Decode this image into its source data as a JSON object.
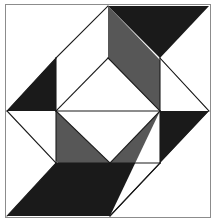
{
  "canvas": {
    "width": 216,
    "height": 223,
    "background_color": "#ffffff",
    "title": "Quilt Block Pattern"
  },
  "frame": {
    "border_color": "#8c8c8c",
    "border_width": 1,
    "margin_color": "#ffffff",
    "inset_left": 5,
    "inset_top": 4,
    "inset_right": 211,
    "inset_bottom": 218
  },
  "palette": {
    "black": "#1a1a1a",
    "gray": "#575757",
    "white": "#ffffff",
    "outline": "#1a1a1a",
    "outline_width": 1.1
  },
  "geometry": {
    "field_left": 7,
    "field_top": 6,
    "field_right": 209,
    "field_bottom": 216,
    "center_x": 108,
    "center_y": 111,
    "mid_top_x": 108,
    "mid_bottom_x": 110,
    "mid_left_y": 111,
    "mid_right_y": 111,
    "diamond_top_y": 58,
    "diamond_bottom_y": 163,
    "diamond_left_x": 56,
    "diamond_right_x": 160
  },
  "shapes": [
    {
      "id": "gray-field",
      "name": "gray-background-field",
      "fill": "gray",
      "points": "7,6 209,6 209,216 7,216"
    },
    {
      "id": "corner-tl",
      "name": "corner-triangle-top-left",
      "fill": "white",
      "points": "7,6 108,6 7,111"
    },
    {
      "id": "corner-tr",
      "name": "corner-triangle-top-right",
      "fill": "white",
      "points": "108,6 209,6 209,111"
    },
    {
      "id": "corner-br",
      "name": "corner-triangle-bottom-right",
      "fill": "white",
      "points": "209,111 209,216 110,216"
    },
    {
      "id": "corner-bl",
      "name": "corner-triangle-bottom-left",
      "fill": "white",
      "points": "7,111 110,216 7,216"
    },
    {
      "id": "black-tl",
      "name": "black-triangle-top-left",
      "fill": "black",
      "points": "7,111 56,58 56,163"
    },
    {
      "id": "black-tr",
      "name": "black-triangle-top-right",
      "fill": "black",
      "points": "108,6 209,6 160,58"
    },
    {
      "id": "black-bl",
      "name": "black-triangle-bottom-left",
      "fill": "black",
      "points": "7,216 56,163 160,163 110,216"
    },
    {
      "id": "black-br",
      "name": "black-triangle-bottom-right",
      "fill": "black",
      "points": "160,58 209,111 160,163"
    },
    {
      "id": "white-tl-kite",
      "name": "white-kite-top-left",
      "fill": "white",
      "points": "56,58 108,6 108,111 56,111"
    },
    {
      "id": "white-tr-kite",
      "name": "white-kite-top-right",
      "fill": "white",
      "points": "160,58 209,111 160,111"
    },
    {
      "id": "white-bl-kite",
      "name": "white-kite-bottom-left",
      "fill": "white",
      "points": "7,111 56,163 56,111"
    },
    {
      "id": "white-br-kite",
      "name": "white-kite-bottom-right",
      "fill": "white",
      "points": "110,216 160,163 160,111"
    },
    {
      "id": "center-diamond-upper",
      "name": "center-diamond-upper-half",
      "fill": "white",
      "points": "108,58 160,111 56,111"
    },
    {
      "id": "center-diamond-lower",
      "name": "center-diamond-lower-half",
      "fill": "white",
      "points": "56,111 160,111 110,163"
    }
  ],
  "outlines": [
    {
      "id": "line-diamond-ne",
      "name": "diamond-edge-northeast",
      "d": "M 108,58 L 160,111"
    },
    {
      "id": "line-diamond-nw",
      "name": "diamond-edge-northwest",
      "d": "M 108,58 L 56,111"
    },
    {
      "id": "line-diamond-sw",
      "name": "diamond-edge-southwest",
      "d": "M 56,111 L 110,163"
    },
    {
      "id": "line-diamond-se",
      "name": "diamond-edge-southeast",
      "d": "M 160,111 L 110,163"
    },
    {
      "id": "line-horizontal-mid",
      "name": "horizontal-midline",
      "d": "M 56,111 L 160,111"
    },
    {
      "id": "line-tl-vert",
      "name": "inner-square-left-edge",
      "d": "M 56,58 L 56,111"
    },
    {
      "id": "line-tl-top",
      "name": "inner-square-top-edge",
      "d": "M 56,58 L 108,6"
    },
    {
      "id": "line-bl-diag",
      "name": "lower-left-diagonal",
      "d": "M 7,111 L 56,163"
    },
    {
      "id": "line-bl-vert",
      "name": "lower-left-vertical",
      "d": "M 56,111 L 56,163"
    },
    {
      "id": "line-bottom-band",
      "name": "lower-band-top-edge",
      "d": "M 56,163 L 160,163"
    },
    {
      "id": "line-br-vert",
      "name": "lower-right-vertical",
      "d": "M 160,111 L 160,163"
    },
    {
      "id": "line-br-diag",
      "name": "lower-right-diagonal",
      "d": "M 160,163 L 110,216"
    },
    {
      "id": "line-tr-vert",
      "name": "upper-right-vertical",
      "d": "M 160,58 L 160,111"
    },
    {
      "id": "line-tr-diag",
      "name": "upper-right-diagonal",
      "d": "M 160,58 L 209,111"
    },
    {
      "id": "line-tl-black-diag",
      "name": "upper-left-black-diagonal",
      "d": "M 7,111 L 56,58"
    },
    {
      "id": "line-bl-white-diag",
      "name": "bottom-left-white-diagonal",
      "d": "M 7,216 L 56,163"
    },
    {
      "id": "line-br-white-diag",
      "name": "bottom-right-white-diagonal",
      "d": "M 110,216 L 160,163"
    }
  ],
  "labels": {
    "alt_text": "Symmetric geometric quilt block with black, gray and white triangles around a central white diamond"
  }
}
